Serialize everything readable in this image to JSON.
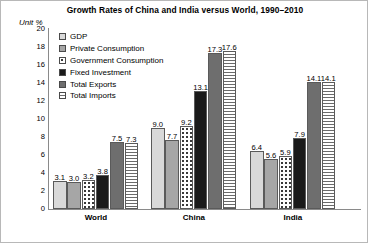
{
  "chart_data": {
    "type": "bar",
    "title": "Growth Rates of China and India versus World, 1990–2010",
    "unit_label": "Unit %",
    "xlabel": "",
    "ylabel": "",
    "ylim": [
      0,
      20
    ],
    "ytick_step": 2,
    "yticks": [
      "20",
      "18",
      "16",
      "14",
      "12",
      "10",
      "8",
      "6",
      "4",
      "2",
      "0"
    ],
    "grid": false,
    "legend_position": "upper-left-inside",
    "categories": [
      "World",
      "China",
      "India"
    ],
    "series": [
      {
        "name": "GDP",
        "pattern": "light-gray-solid",
        "color": "#d9d9d9",
        "values": [
          3.1,
          9.0,
          6.4
        ],
        "labels": [
          "3.1",
          "9.0",
          "6.4"
        ]
      },
      {
        "name": "Private Consumption",
        "pattern": "medium-gray-solid",
        "color": "#a6a6a6",
        "values": [
          3.0,
          7.7,
          5.6
        ],
        "labels": [
          "3.0",
          "7.7",
          "5.6"
        ]
      },
      {
        "name": "Government Consumption",
        "pattern": "dotted",
        "color": "#ffffff",
        "values": [
          3.2,
          9.2,
          5.9
        ],
        "labels": [
          "3.2",
          "9.2",
          "5.9"
        ]
      },
      {
        "name": "Fixed Investment",
        "pattern": "black-solid",
        "color": "#1a1a1a",
        "values": [
          3.8,
          13.1,
          7.9
        ],
        "labels": [
          "3.8",
          "13.1",
          "7.9"
        ]
      },
      {
        "name": "Total Exports",
        "pattern": "dark-gray-solid",
        "color": "#6e6e6e",
        "values": [
          7.5,
          17.3,
          14.1
        ],
        "labels": [
          "7.5",
          "17.3",
          "14.1"
        ]
      },
      {
        "name": "Total Imports",
        "pattern": "horizontal-stripes",
        "color": "#ffffff",
        "values": [
          7.3,
          17.6,
          14.1
        ],
        "labels": [
          "7.3",
          "17.6",
          "14.1"
        ]
      }
    ]
  }
}
